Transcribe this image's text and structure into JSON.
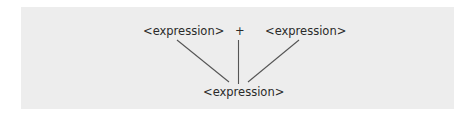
{
  "diagram": {
    "type": "parse-tree",
    "background_color": "#ededed",
    "line_color": "#555555",
    "nodes": {
      "left_child": "<expression>",
      "operator": "+",
      "right_child": "<expression>",
      "parent": "<expression>"
    }
  }
}
